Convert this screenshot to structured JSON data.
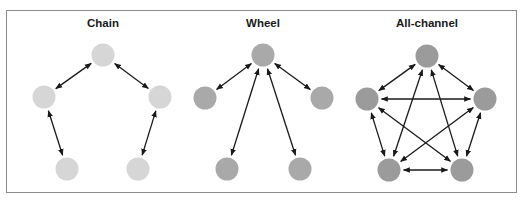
{
  "figure": {
    "panels": [
      {
        "id": "chain",
        "title": "Chain",
        "node_color": "#d6d6d6",
        "title_x": 103,
        "nodes": [
          {
            "id": "top",
            "x": 103,
            "y": 55
          },
          {
            "id": "left",
            "x": 44,
            "y": 97
          },
          {
            "id": "right",
            "x": 160,
            "y": 97
          },
          {
            "id": "bottom-left",
            "x": 67,
            "y": 169
          },
          {
            "id": "bottom-right",
            "x": 138,
            "y": 169
          }
        ],
        "edges": [
          [
            "top",
            "left"
          ],
          [
            "top",
            "right"
          ],
          [
            "left",
            "bottom-left"
          ],
          [
            "right",
            "bottom-right"
          ]
        ]
      },
      {
        "id": "wheel",
        "title": "Wheel",
        "node_color": "#a9a9a9",
        "title_x": 263,
        "nodes": [
          {
            "id": "top",
            "x": 263,
            "y": 55
          },
          {
            "id": "left",
            "x": 205,
            "y": 98
          },
          {
            "id": "right",
            "x": 322,
            "y": 98
          },
          {
            "id": "bottom-left",
            "x": 227,
            "y": 169
          },
          {
            "id": "bottom-right",
            "x": 300,
            "y": 169
          }
        ],
        "edges": [
          [
            "top",
            "left"
          ],
          [
            "top",
            "right"
          ],
          [
            "top",
            "bottom-left"
          ],
          [
            "top",
            "bottom-right"
          ]
        ]
      },
      {
        "id": "all-channel",
        "title": "All-channel",
        "node_color": "#9b9b9b",
        "title_x": 427,
        "nodes": [
          {
            "id": "top",
            "x": 427,
            "y": 56
          },
          {
            "id": "left",
            "x": 367,
            "y": 99
          },
          {
            "id": "right",
            "x": 485,
            "y": 99
          },
          {
            "id": "bottom-left",
            "x": 389,
            "y": 170
          },
          {
            "id": "bottom-right",
            "x": 462,
            "y": 170
          }
        ],
        "edges": [
          [
            "top",
            "left"
          ],
          [
            "top",
            "right"
          ],
          [
            "top",
            "bottom-left"
          ],
          [
            "top",
            "bottom-right"
          ],
          [
            "left",
            "right"
          ],
          [
            "left",
            "bottom-left"
          ],
          [
            "left",
            "bottom-right"
          ],
          [
            "right",
            "bottom-left"
          ],
          [
            "right",
            "bottom-right"
          ],
          [
            "bottom-left",
            "bottom-right"
          ]
        ]
      }
    ],
    "node_radius": 11.5,
    "edge_color": "#1a1a1a",
    "border_color": "#8c8c8c"
  }
}
